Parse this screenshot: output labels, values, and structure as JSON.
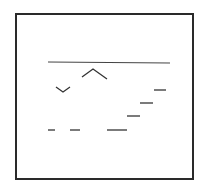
{
  "diagram": {
    "type": "line-sketch",
    "background": "#ffffff",
    "stroke_color": "#2a2a2a",
    "frame": {
      "x": 16,
      "y": 14,
      "width": 177,
      "height": 165,
      "stroke_width": 2
    },
    "top_line": {
      "x1": 48,
      "y1": 62,
      "x2": 170,
      "y2": 63
    },
    "caret_up": {
      "points": "82,77 93,69 107,79"
    },
    "caret_down": {
      "points": "56,87 63,92 70,87"
    },
    "stair_segments": [
      {
        "x1": 154,
        "y1": 90,
        "x2": 166,
        "y2": 90
      },
      {
        "x1": 140,
        "y1": 103,
        "x2": 153,
        "y2": 103
      },
      {
        "x1": 127,
        "y1": 116,
        "x2": 140,
        "y2": 116
      }
    ],
    "dashes": [
      {
        "x1": 48,
        "y1": 130,
        "x2": 55,
        "y2": 130
      },
      {
        "x1": 70,
        "y1": 130,
        "x2": 80,
        "y2": 130
      },
      {
        "x1": 107,
        "y1": 130,
        "x2": 127,
        "y2": 130
      }
    ]
  }
}
